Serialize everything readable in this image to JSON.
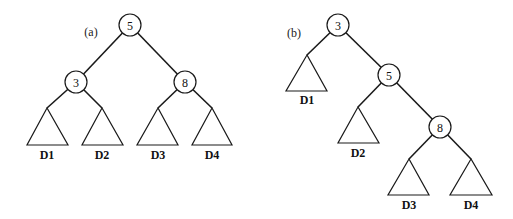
{
  "figure": {
    "panels": [
      {
        "label": "(a)",
        "label_pos": [
          91,
          32
        ],
        "nodes": [
          {
            "id": "5",
            "x": 130,
            "y": 25
          },
          {
            "id": "3",
            "x": 76,
            "y": 82
          },
          {
            "id": "8",
            "x": 185,
            "y": 82
          }
        ],
        "edges": [
          {
            "from": [
              130,
              25
            ],
            "to": [
              76,
              82
            ]
          },
          {
            "from": [
              130,
              25
            ],
            "to": [
              185,
              82
            ]
          },
          {
            "from": [
              76,
              82
            ],
            "to": [
              47,
              108
            ]
          },
          {
            "from": [
              76,
              82
            ],
            "to": [
              102,
              108
            ]
          },
          {
            "from": [
              185,
              82
            ],
            "to": [
              158,
              108
            ]
          },
          {
            "from": [
              185,
              82
            ],
            "to": [
              212,
              108
            ]
          }
        ],
        "subtrees": [
          {
            "label": "D1",
            "apex": [
              47,
              108
            ],
            "base_left": 27,
            "base_right": 68,
            "base_y": 145,
            "label_y": 155
          },
          {
            "label": "D2",
            "apex": [
              102,
              108
            ],
            "base_left": 82,
            "base_right": 123,
            "base_y": 145,
            "label_y": 155
          },
          {
            "label": "D3",
            "apex": [
              158,
              108
            ],
            "base_left": 137,
            "base_right": 178,
            "base_y": 145,
            "label_y": 155
          },
          {
            "label": "D4",
            "apex": [
              212,
              108
            ],
            "base_left": 192,
            "base_right": 232,
            "base_y": 145,
            "label_y": 155
          }
        ]
      },
      {
        "label": "(b)",
        "label_pos": [
          294,
          33
        ],
        "nodes": [
          {
            "id": "3",
            "x": 338,
            "y": 25
          },
          {
            "id": "5",
            "x": 389,
            "y": 75
          },
          {
            "id": "8",
            "x": 440,
            "y": 127
          }
        ],
        "edges": [
          {
            "from": [
              338,
              25
            ],
            "to": [
              307,
              55
            ]
          },
          {
            "from": [
              338,
              25
            ],
            "to": [
              389,
              75
            ]
          },
          {
            "from": [
              389,
              75
            ],
            "to": [
              358,
              107
            ]
          },
          {
            "from": [
              389,
              75
            ],
            "to": [
              440,
              127
            ]
          },
          {
            "from": [
              440,
              127
            ],
            "to": [
              409,
              159
            ]
          },
          {
            "from": [
              440,
              127
            ],
            "to": [
              471,
              159
            ]
          }
        ],
        "subtrees": [
          {
            "label": "D1",
            "apex": [
              307,
              55
            ],
            "base_left": 286,
            "base_right": 327,
            "base_y": 91,
            "label_y": 100
          },
          {
            "label": "D2",
            "apex": [
              358,
              107
            ],
            "base_left": 338,
            "base_right": 379,
            "base_y": 143,
            "label_y": 153
          },
          {
            "label": "D3",
            "apex": [
              409,
              159
            ],
            "base_left": 388,
            "base_right": 429,
            "base_y": 195,
            "label_y": 205
          },
          {
            "label": "D4",
            "apex": [
              471,
              159
            ],
            "base_left": 450,
            "base_right": 492,
            "base_y": 195,
            "label_y": 205
          }
        ]
      }
    ],
    "node_radius": 11
  }
}
